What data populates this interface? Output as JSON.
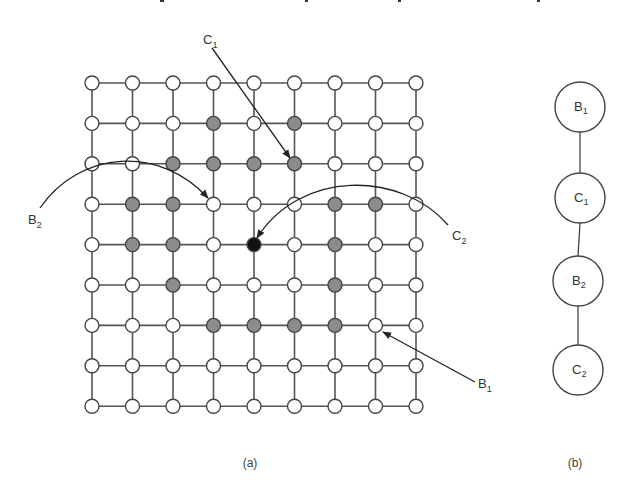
{
  "figure": {
    "panel_a": {
      "caption": "(a)",
      "grid": {
        "rows": 9,
        "cols": 9,
        "x0": 92,
        "dx": 40.5,
        "y0": 83,
        "dy": 40.4,
        "node_radius": 7,
        "colors": {
          "white": "#ffffff",
          "gray": "#8c8c8c",
          "black": "#111111",
          "stroke": "#555555"
        },
        "gray_nodes": [
          [
            1,
            3
          ],
          [
            1,
            5
          ],
          [
            2,
            2
          ],
          [
            2,
            3
          ],
          [
            2,
            4
          ],
          [
            2,
            5
          ],
          [
            3,
            1
          ],
          [
            3,
            2
          ],
          [
            3,
            6
          ],
          [
            3,
            7
          ],
          [
            4,
            1
          ],
          [
            4,
            2
          ],
          [
            4,
            6
          ],
          [
            5,
            2
          ],
          [
            5,
            6
          ],
          [
            6,
            3
          ],
          [
            6,
            4
          ],
          [
            6,
            5
          ],
          [
            6,
            6
          ]
        ],
        "black_nodes": [
          [
            4,
            4
          ]
        ]
      },
      "annotations": [
        {
          "label": "C",
          "sub": "1",
          "x": 203,
          "y": 44,
          "target": [
            2,
            5
          ],
          "kind": "line"
        },
        {
          "label": "B",
          "sub": "2",
          "x": 28,
          "y": 224,
          "target": [
            3,
            3
          ],
          "kind": "arc"
        },
        {
          "label": "C",
          "sub": "2",
          "x": 452,
          "y": 240,
          "target": [
            4,
            4
          ],
          "kind": "arc"
        },
        {
          "label": "B",
          "sub": "1",
          "x": 478,
          "y": 388,
          "target": [
            6,
            7
          ],
          "kind": "line"
        }
      ]
    },
    "panel_b": {
      "caption": "(b)",
      "nodes": [
        {
          "label": "B",
          "sub": "1",
          "cx": 580,
          "cy": 107
        },
        {
          "label": "C",
          "sub": "1",
          "cx": 580,
          "cy": 198
        },
        {
          "label": "B",
          "sub": "2",
          "cx": 578,
          "cy": 281
        },
        {
          "label": "C",
          "sub": "2",
          "cx": 578,
          "cy": 370
        }
      ],
      "radius": 25
    }
  }
}
